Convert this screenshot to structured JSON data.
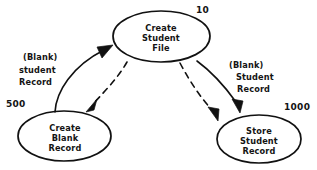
{
  "diagram": {
    "type": "data-flow-diagram",
    "style": "hand-drawn-sketch",
    "ink_color": "#111111",
    "background_color": "#ffffff",
    "nodes": [
      {
        "id": "create-student-file",
        "number": "10",
        "line1": "Create",
        "line2": "Student",
        "line3": "File",
        "position": "top-center"
      },
      {
        "id": "create-blank-record",
        "number": "500",
        "line1": "Create",
        "line2": "Blank",
        "line3": "Record",
        "position": "bottom-left"
      },
      {
        "id": "store-student-record",
        "number": "1000",
        "line1": "Store",
        "line2": "Student",
        "line3": "Record",
        "position": "bottom-right"
      }
    ],
    "edges": [
      {
        "id": "blank-record-to-file",
        "from": "create-blank-record",
        "to": "create-student-file",
        "line_style": "solid",
        "label_line1": "(Blank)",
        "label_line2": "student",
        "label_line3": "Record"
      },
      {
        "id": "file-to-blank-record",
        "from": "create-student-file",
        "to": "create-blank-record",
        "line_style": "dashed",
        "label_line1": "",
        "label_line2": "",
        "label_line3": ""
      },
      {
        "id": "file-to-store-record-solid",
        "from": "create-student-file",
        "to": "store-student-record",
        "line_style": "solid",
        "label_line1": "(Blank)",
        "label_line2": "Student",
        "label_line3": "Record"
      },
      {
        "id": "file-to-store-record-dashed",
        "from": "create-student-file",
        "to": "store-student-record",
        "line_style": "dashed",
        "label_line1": "",
        "label_line2": "",
        "label_line3": ""
      }
    ]
  }
}
